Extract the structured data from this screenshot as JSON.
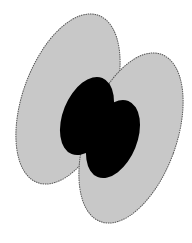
{
  "diagram": {
    "colors": {
      "background": "#ffffff",
      "outer_fill": "#c8c8c8",
      "outer_stroke": "#555555",
      "inner_fill": "#000000"
    },
    "shapes": [
      {
        "name": "outer-lobe-left",
        "cx": 68,
        "cy": 99,
        "rx": 45,
        "ry": 89,
        "rotate": 20
      },
      {
        "name": "outer-lobe-right",
        "cx": 131,
        "cy": 138,
        "rx": 45,
        "ry": 89,
        "rotate": 20
      },
      {
        "name": "inner-lobe-left",
        "cx": 87,
        "cy": 116,
        "rx": 24,
        "ry": 41,
        "rotate": 22
      },
      {
        "name": "inner-lobe-right",
        "cx": 113,
        "cy": 139,
        "rx": 24,
        "ry": 41,
        "rotate": 22
      }
    ]
  }
}
